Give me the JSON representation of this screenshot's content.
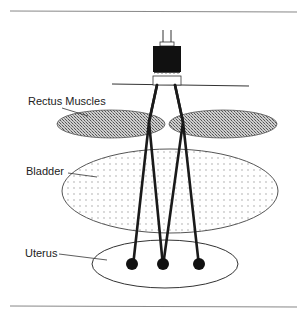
{
  "diagram": {
    "labels": {
      "rectus": "Rectus Muscles",
      "bladder": "Bladder",
      "uterus": "Uterus"
    },
    "colors": {
      "line": "#1a1a1a",
      "rule": "#888888",
      "ellipse_stroke": "#555555"
    },
    "electrodes": 3
  }
}
